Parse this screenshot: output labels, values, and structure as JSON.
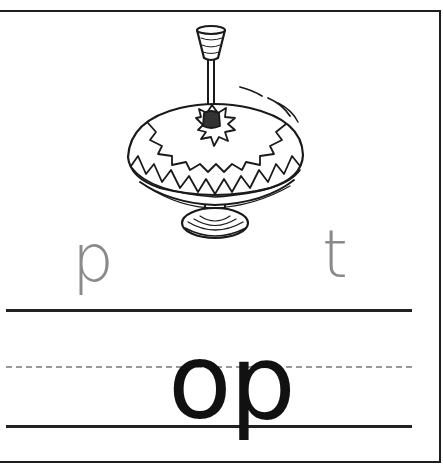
{
  "worksheet": {
    "picture": "spinning-top",
    "hint_letters": {
      "left": "p",
      "right": "t"
    },
    "word_fragment": "op",
    "colors": {
      "hint_letter": "#8a8a8a",
      "word": "#111111",
      "rule_solid": "#222222",
      "rule_dashed": "#9a9a9a",
      "border": "#1e1e1e"
    }
  }
}
